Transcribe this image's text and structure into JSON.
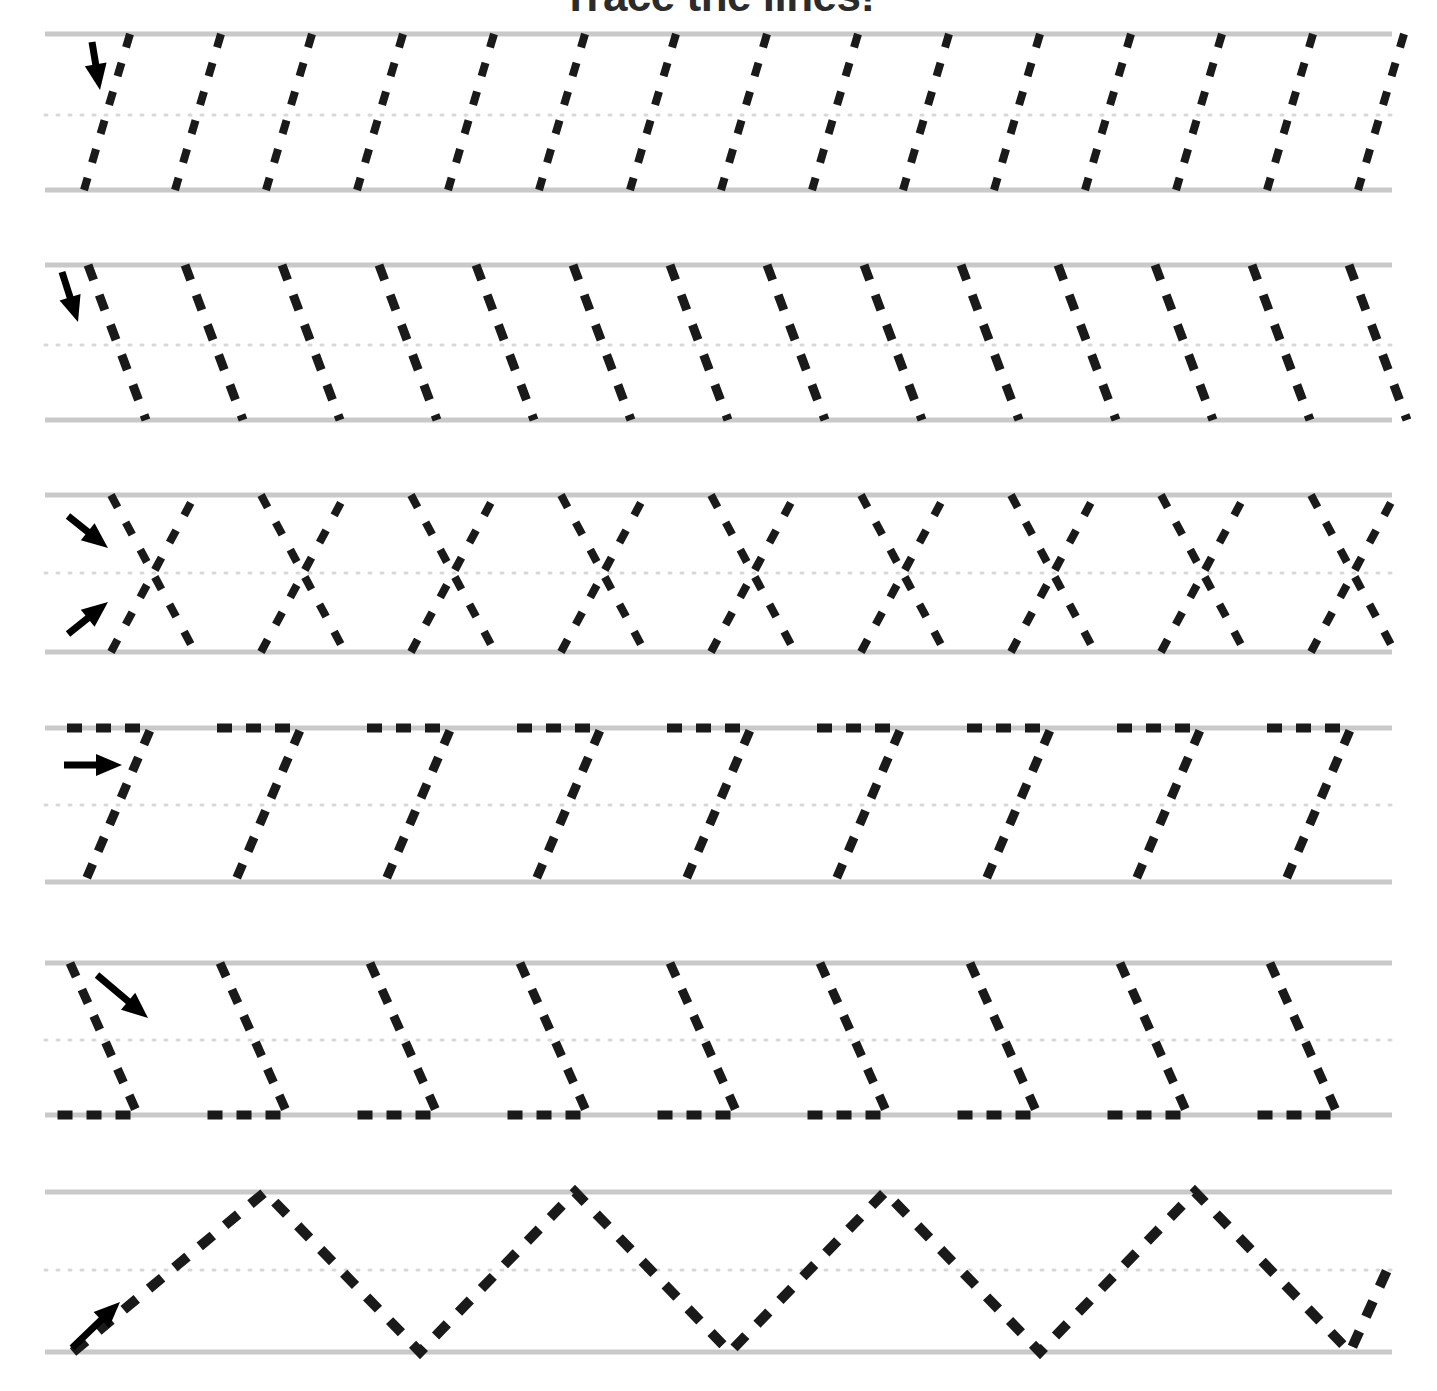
{
  "worksheet": {
    "title": "Trace the lines!",
    "title_color": "#2b2b2b",
    "page_width": 1437,
    "page_height": 1391,
    "background_color": "#ffffff",
    "guide_line_color": "#c9c9c9",
    "dotted_midline_color": "#d8d8d8",
    "trace_stroke_color": "#1a1a1a",
    "arrow_color": "#000000",
    "rule_left": 45,
    "rule_right": 1392
  },
  "rows": [
    {
      "id": "row-1",
      "name": "slanted-strokes-left-lean",
      "pattern_label": "slanted lines leaning left",
      "top_y": 34,
      "mid_y": 115,
      "bottom_y": 190,
      "stroke_count": 15,
      "stroke_spacing": 91,
      "first_stroke_top_x": 130,
      "slant_dx": -46,
      "dash_pattern": "14 16",
      "stroke_width": 8,
      "arrow": {
        "name": "arrow-down",
        "direction": "down",
        "x1": 92,
        "y1": 42,
        "x2": 100,
        "y2": 90
      }
    },
    {
      "id": "row-2",
      "name": "steep-slanted-strokes-right-lean",
      "pattern_label": "steep slanted lines leaning right",
      "top_y": 265,
      "mid_y": 345,
      "bottom_y": 420,
      "stroke_count": 14,
      "stroke_spacing": 97,
      "first_stroke_top_x": 88,
      "slant_dx": 58,
      "dash_pattern": "16 16",
      "stroke_width": 9,
      "arrow": {
        "name": "arrow-down",
        "direction": "down",
        "x1": 62,
        "y1": 272,
        "x2": 78,
        "y2": 322
      }
    },
    {
      "id": "row-3",
      "name": "crossed-x-strokes",
      "pattern_label": "crossing X strokes",
      "top_y": 495,
      "mid_y": 573,
      "bottom_y": 652,
      "stroke_count": 9,
      "stroke_spacing": 150,
      "first_cross_center_x": 153,
      "half_width": 42,
      "dash_pattern": "14 17",
      "stroke_width": 8,
      "arrows": [
        {
          "name": "arrow-down-right",
          "direction": "down-right",
          "x1": 68,
          "y1": 516,
          "x2": 108,
          "y2": 548
        },
        {
          "name": "arrow-up-right",
          "direction": "up-right",
          "x1": 68,
          "y1": 634,
          "x2": 108,
          "y2": 602
        }
      ]
    },
    {
      "id": "row-4",
      "name": "zigzag-top-flat-then-down-left",
      "pattern_label": "flat top stroke then diagonal down-left",
      "top_y": 728,
      "mid_y": 805,
      "bottom_y": 882,
      "stroke_count": 9,
      "stroke_spacing": 150,
      "first_segment_start_x": 67,
      "flat_length": 84,
      "diagonal_dx": -66,
      "dash_pattern": "15 14",
      "stroke_width": 9,
      "arrow": {
        "name": "arrow-right",
        "direction": "right",
        "x1": 64,
        "y1": 765,
        "x2": 122,
        "y2": 765
      }
    },
    {
      "id": "row-5",
      "name": "zigzag-down-right-then-flat-bottom",
      "pattern_label": "diagonal down-right then flat bottom stroke",
      "top_y": 963,
      "mid_y": 1040,
      "bottom_y": 1115,
      "stroke_count": 9,
      "stroke_spacing": 150,
      "first_segment_start_x": 70,
      "diagonal_dx": 68,
      "flat_length": 82,
      "dash_pattern": "15 14",
      "stroke_width": 9,
      "arrow": {
        "name": "arrow-down-right",
        "direction": "down-right",
        "x1": 97,
        "y1": 975,
        "x2": 148,
        "y2": 1018
      }
    },
    {
      "id": "row-6",
      "name": "mountain-zigzag",
      "pattern_label": "large zigzag peaks and valleys",
      "top_y": 1192,
      "mid_y": 1270,
      "bottom_y": 1352,
      "peak_count": 4,
      "peak_spacing": 310,
      "start_x": 73,
      "first_peak_x": 265,
      "dash_pattern": "17 16",
      "stroke_width": 10,
      "arrow": {
        "name": "arrow-up-right",
        "direction": "up-right",
        "x1": 72,
        "y1": 1348,
        "x2": 120,
        "y2": 1302
      }
    }
  ]
}
